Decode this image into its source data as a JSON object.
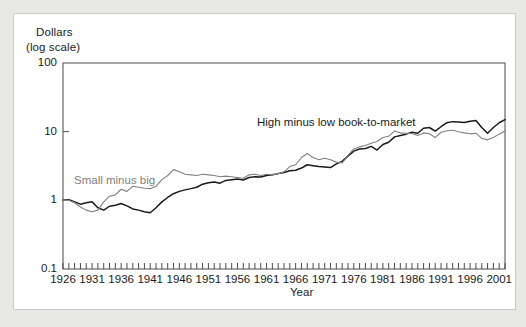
{
  "figure": {
    "background_color": "#e8e8e6",
    "card_color": "#ffffff",
    "frame_color": "#4a4a4a"
  },
  "chart_data": {
    "type": "line",
    "title": "",
    "subtitle": "",
    "ylabel_line1": "Dollars",
    "ylabel_line2": "(log scale)",
    "xlabel": "Year",
    "yscale": "log",
    "ylim": [
      0.1,
      100
    ],
    "ytick_labels": [
      "100",
      "10",
      "1",
      "0.1"
    ],
    "ytick_values": [
      100,
      10,
      1,
      0.1
    ],
    "xlim": [
      1926,
      2002
    ],
    "xtick_labels": [
      "1926",
      "1931",
      "1936",
      "1941",
      "1946",
      "1951",
      "1956",
      "1961",
      "1966",
      "1971",
      "1976",
      "1981",
      "1986",
      "1991",
      "1996",
      "2001"
    ],
    "xtick_values": [
      1926,
      1931,
      1936,
      1941,
      1946,
      1951,
      1956,
      1961,
      1966,
      1971,
      1976,
      1981,
      1986,
      1991,
      1996,
      2001
    ],
    "minor_xticks": "every year",
    "grid": false,
    "legend_position": "inline-annotations",
    "x": [
      1926,
      1927,
      1928,
      1929,
      1930,
      1931,
      1932,
      1933,
      1934,
      1935,
      1936,
      1937,
      1938,
      1939,
      1940,
      1941,
      1942,
      1943,
      1944,
      1945,
      1946,
      1947,
      1948,
      1949,
      1950,
      1951,
      1952,
      1953,
      1954,
      1955,
      1956,
      1957,
      1958,
      1959,
      1960,
      1961,
      1962,
      1963,
      1964,
      1965,
      1966,
      1967,
      1968,
      1969,
      1970,
      1971,
      1972,
      1973,
      1974,
      1975,
      1976,
      1977,
      1978,
      1979,
      1980,
      1981,
      1982,
      1983,
      1984,
      1985,
      1986,
      1987,
      1988,
      1989,
      1990,
      1991,
      1992,
      1993,
      1994,
      1995,
      1996,
      1997,
      1998,
      1999,
      2000,
      2001,
      2002
    ],
    "series": [
      {
        "name": "High minus low book-to-market",
        "color": "#1a1a1a",
        "label_text": "High minus low book-to-market",
        "values": [
          1.0,
          1.02,
          0.95,
          0.88,
          0.92,
          0.95,
          0.78,
          0.72,
          0.82,
          0.85,
          0.9,
          0.83,
          0.75,
          0.72,
          0.68,
          0.66,
          0.78,
          0.95,
          1.1,
          1.25,
          1.35,
          1.42,
          1.48,
          1.55,
          1.72,
          1.8,
          1.85,
          1.78,
          1.95,
          2.0,
          2.05,
          1.98,
          2.15,
          2.2,
          2.18,
          2.3,
          2.35,
          2.45,
          2.55,
          2.7,
          2.75,
          2.95,
          3.3,
          3.2,
          3.1,
          3.05,
          3.0,
          3.4,
          3.7,
          4.4,
          5.2,
          5.6,
          5.7,
          6.1,
          5.4,
          6.5,
          7.0,
          8.4,
          8.8,
          9.2,
          9.8,
          9.5,
          11.2,
          11.5,
          10.2,
          11.8,
          13.5,
          14.0,
          13.8,
          13.6,
          14.2,
          14.5,
          11.5,
          9.5,
          11.5,
          13.5,
          15.0
        ]
      },
      {
        "name": "Small minus big",
        "color": "#808080",
        "label_text": "Small minus big",
        "values": [
          1.0,
          1.0,
          0.92,
          0.8,
          0.72,
          0.68,
          0.72,
          0.95,
          1.15,
          1.2,
          1.45,
          1.35,
          1.6,
          1.55,
          1.5,
          1.48,
          1.6,
          2.0,
          2.3,
          2.8,
          2.6,
          2.4,
          2.35,
          2.3,
          2.4,
          2.35,
          2.3,
          2.2,
          2.25,
          2.2,
          2.15,
          2.1,
          2.35,
          2.4,
          2.3,
          2.4,
          2.35,
          2.45,
          2.6,
          3.1,
          3.3,
          4.2,
          4.8,
          4.2,
          3.9,
          4.1,
          3.9,
          3.6,
          3.5,
          4.5,
          5.6,
          6.0,
          6.3,
          6.8,
          7.2,
          8.2,
          8.6,
          10.2,
          9.6,
          9.5,
          9.4,
          8.8,
          9.6,
          9.3,
          8.2,
          9.8,
          10.3,
          10.5,
          10.0,
          9.6,
          9.3,
          9.5,
          8.0,
          7.6,
          8.2,
          9.2,
          10.2
        ]
      }
    ]
  },
  "annotations": {
    "high_minus_low": "High minus low book-to-market",
    "small_minus_big": "Small minus big"
  }
}
